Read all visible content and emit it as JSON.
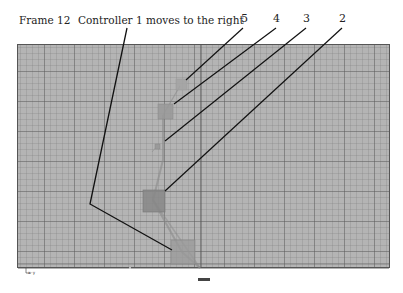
{
  "header": {
    "frame_label": "Frame 12",
    "description": "Controller 1 moves to the right"
  },
  "callouts": [
    {
      "label": "5",
      "target": "controller-5"
    },
    {
      "label": "4",
      "target": "controller-4"
    },
    {
      "label": "3",
      "target": "controller-3"
    },
    {
      "label": "2",
      "target": "controller-2"
    }
  ],
  "viewport": {
    "axis_origin_label": "x-y",
    "bottom_label": "persp",
    "background": "#b4b4b4",
    "grid_major": "#6e6e6e",
    "frame_border": "#555555"
  },
  "controllers": [
    {
      "id": "1",
      "x": 170,
      "y": 238,
      "size": 22
    },
    {
      "id": "2",
      "x": 143,
      "y": 190,
      "size": 22
    },
    {
      "id": "3",
      "x": 155,
      "y": 146,
      "size": 6
    },
    {
      "id": "4",
      "x": 158,
      "y": 104,
      "size": 15
    },
    {
      "id": "5",
      "x": 175,
      "y": 80,
      "size": 11
    }
  ]
}
